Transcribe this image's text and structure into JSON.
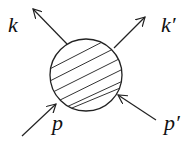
{
  "diagram": {
    "type": "scattering-vertex",
    "blob": {
      "shape": "hatched-circle",
      "cx": 86,
      "cy": 75,
      "r": 36
    },
    "legs": [
      {
        "label": "k",
        "direction": "outgoing"
      },
      {
        "label": "k′",
        "direction": "outgoing"
      },
      {
        "label": "p",
        "direction": "incoming"
      },
      {
        "label": "p′",
        "direction": "incoming"
      }
    ],
    "colors": {
      "stroke": "#222222",
      "background": "#ffffff"
    }
  }
}
